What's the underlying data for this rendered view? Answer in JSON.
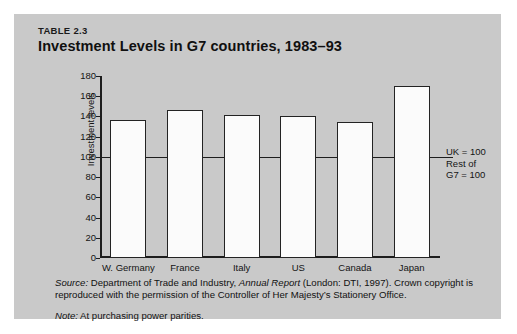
{
  "figure": {
    "table_number": "TABLE 2.3",
    "title": "Investment Levels in G7 countries, 1983–93"
  },
  "annotation": {
    "line1": "UK = 100",
    "line2": "Rest of",
    "line3": "G7 = 100"
  },
  "notes": {
    "source_lead": "Source:",
    "source_part1": " Department of Trade and Industry, ",
    "source_work": "Annual Report",
    "source_part2": " (London: DTI, 1997). Crown copyright is reproduced with the permission of the Controller of Her Majesty’s Stationery Office.",
    "note_lead": "Note:",
    "note_text": " At purchasing power parities."
  },
  "chart_data": {
    "type": "bar",
    "title": "Investment Levels in G7 countries, 1983–93",
    "xlabel": "",
    "ylabel": "Investment levels",
    "categories": [
      "W. Germany",
      "France",
      "Italy",
      "US",
      "Canada",
      "Japan"
    ],
    "values": [
      136,
      146,
      141,
      140,
      135,
      170
    ],
    "ylim": [
      0,
      180
    ],
    "yticks": [
      0,
      20,
      40,
      60,
      80,
      100,
      120,
      140,
      160,
      180
    ],
    "ytick_labels": [
      "0",
      "20",
      "40",
      "60",
      "80",
      "100",
      "120",
      "140",
      "160",
      "180"
    ],
    "grid": false,
    "legend": null,
    "reference_line": {
      "value": 100,
      "label": "UK = 100 / Rest of G7 = 100"
    },
    "bar_fill": "#fbfbfb",
    "bar_edge": "#232323",
    "background": "#c9c9c9"
  }
}
